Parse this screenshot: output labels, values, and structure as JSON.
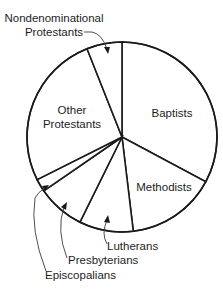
{
  "chart_data": {
    "type": "pie",
    "title": "",
    "start_angle_deg": 0,
    "direction": "clockwise",
    "unit": "percent (estimated from slice angles)",
    "categories": [
      "Baptists",
      "Methodists",
      "Lutherans",
      "Presbyterians",
      "Episcopalians",
      "Other Protestants",
      "Nondenominational Protestants"
    ],
    "values": [
      32.8,
      15.3,
      9.2,
      8.1,
      2.2,
      26.4,
      6.0
    ],
    "legend": "none (direct labels and leader arrows)",
    "colors": {
      "fill": "#ffffff",
      "stroke": "#1a1a1a",
      "text": "#1d1d1d"
    }
  },
  "labels": {
    "baptists": [
      "Baptists"
    ],
    "methodists": [
      "Methodists"
    ],
    "lutherans": [
      "Lutherans"
    ],
    "presbyterians": [
      "Presbyterians"
    ],
    "episcopalians": [
      "Episcopalians"
    ],
    "other": [
      "Other",
      "Protestants"
    ],
    "nondenominational": [
      "Nondenominational",
      "Protestants"
    ]
  }
}
